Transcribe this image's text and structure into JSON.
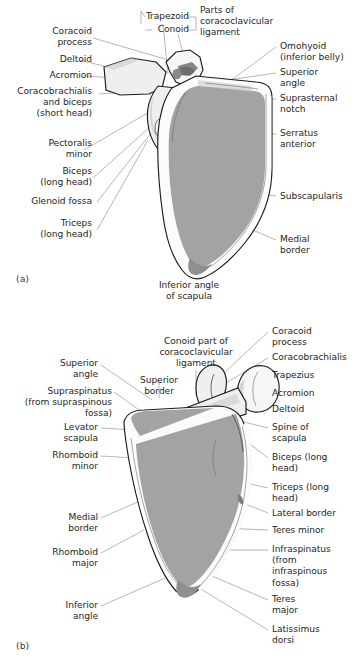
{
  "figure": {
    "colors": {
      "bone_fill_light": "#efefef",
      "bone_fill_gray": "#a3a3a3",
      "outline": "#1c1c1c",
      "leader_line": "#8a8a8a",
      "text": "#262626",
      "background": "#ffffff"
    }
  },
  "panel_a": {
    "letter": "(a)",
    "view": "anterior",
    "labels_left": [
      {
        "id": "coracoid-process",
        "text": "Coracoid\nprocess"
      },
      {
        "id": "deltoid",
        "text": "Deltoid"
      },
      {
        "id": "acromion",
        "text": "Acromion"
      },
      {
        "id": "coracobrachialis-biceps",
        "text": "Coracobrachialis\nand biceps\n(short head)"
      },
      {
        "id": "pectoralis-minor",
        "text": "Pectoralis\nminor"
      },
      {
        "id": "biceps-long-head",
        "text": "Biceps\n(long head)"
      },
      {
        "id": "glenoid-fossa",
        "text": "Glenoid fossa"
      },
      {
        "id": "triceps-long-head",
        "text": "Triceps\n(long head)"
      }
    ],
    "labels_top": [
      {
        "id": "trapezoid",
        "text": "Trapezoid"
      },
      {
        "id": "conoid",
        "text": "Conoid"
      },
      {
        "id": "parts-of-coracoclavicular-ligament",
        "text": "Parts of\ncoracoclavicular\nligament"
      }
    ],
    "labels_right": [
      {
        "id": "omohyoid",
        "text": "Omohyoid\n(inferior belly)"
      },
      {
        "id": "superior-angle",
        "text": "Superior\nangle"
      },
      {
        "id": "suprasternal-notch",
        "text": "Suprasternal\nnotch"
      },
      {
        "id": "serratus-anterior",
        "text": "Serratus\nanterior"
      },
      {
        "id": "subscapularis",
        "text": "Subscapularis"
      },
      {
        "id": "medial-border",
        "text": "Medial\nborder"
      }
    ],
    "labels_bottom": [
      {
        "id": "inferior-angle-of-scapula",
        "text": "Inferior angle\nof scapula"
      }
    ]
  },
  "panel_b": {
    "letter": "(b)",
    "view": "posterior",
    "labels_left": [
      {
        "id": "superior-angle",
        "text": "Superior\nangle"
      },
      {
        "id": "supraspinatus",
        "text": "Supraspinatus\n(from supraspinous\nfossa)"
      },
      {
        "id": "levator-scapula",
        "text": "Levator\nscapula"
      },
      {
        "id": "rhomboid-minor",
        "text": "Rhomboid\nminor"
      },
      {
        "id": "medial-border",
        "text": "Medial\nborder"
      },
      {
        "id": "rhomboid-major",
        "text": "Rhomboid\nmajor"
      },
      {
        "id": "inferior-angle",
        "text": "Inferior\nangle"
      }
    ],
    "labels_top": [
      {
        "id": "conoid-part-of-coracoclavicular-ligament",
        "text": "Conoid part of\ncoracoclavicular\nligament"
      },
      {
        "id": "superior-border",
        "text": "Superior\nborder"
      }
    ],
    "labels_right": [
      {
        "id": "coracoid-process",
        "text": "Coracoid\nprocess"
      },
      {
        "id": "coracobrachialis",
        "text": "Coracobrachialis"
      },
      {
        "id": "trapezius",
        "text": "Trapezius"
      },
      {
        "id": "acromion",
        "text": "Acromion"
      },
      {
        "id": "deltoid",
        "text": "Deltoid"
      },
      {
        "id": "spine-of-scapula",
        "text": "Spine of\nscapula"
      },
      {
        "id": "biceps-long-head",
        "text": "Biceps (long\nhead)"
      },
      {
        "id": "triceps-long-head",
        "text": "Triceps (long\nhead)"
      },
      {
        "id": "lateral-border",
        "text": "Lateral border"
      },
      {
        "id": "teres-minor",
        "text": "Teres minor"
      },
      {
        "id": "infraspinatus",
        "text": "Infraspinatus\n(from\ninfraspinous\nfossa)"
      },
      {
        "id": "teres-major",
        "text": "Teres\nmajor"
      },
      {
        "id": "latissimus-dorsi",
        "text": "Latissimus\ndorsi"
      }
    ]
  }
}
